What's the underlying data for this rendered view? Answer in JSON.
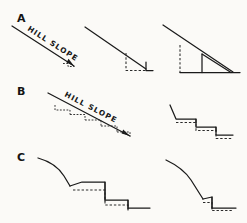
{
  "figure": {
    "background_color": "#fbfaf7",
    "ink_color": "#1a1a1a",
    "style": "hand-drawn line diagram",
    "width": 247,
    "height": 223
  },
  "panels": [
    {
      "letter": "A",
      "slope_label": "HILL SLOPE",
      "description": "Steep hill slope with progressively larger bench cut",
      "diagrams": [
        {
          "name": "slope-arrow-a",
          "caption": "HILL SLOPE"
        },
        {
          "name": "single-small-bench",
          "caption": ""
        },
        {
          "name": "single-large-bench",
          "caption": ""
        }
      ]
    },
    {
      "letter": "B",
      "slope_label": "HILL SLOPE",
      "description": "Gentler hill slope divided into multiple small benches",
      "diagrams": [
        {
          "name": "slope-arrow-b",
          "caption": "HILL SLOPE"
        },
        {
          "name": "multi-step-terrace",
          "caption": ""
        }
      ]
    },
    {
      "letter": "C",
      "slope_label": "",
      "description": "Convex break-of-slope profiles with stepped terraces",
      "diagrams": [
        {
          "name": "two-step-terrace",
          "caption": ""
        },
        {
          "name": "one-step-terrace",
          "caption": ""
        }
      ]
    }
  ],
  "legend": {
    "solid_line_meaning": "finished ground surface",
    "dashed_line_meaning": "original ground surface / cut line"
  }
}
